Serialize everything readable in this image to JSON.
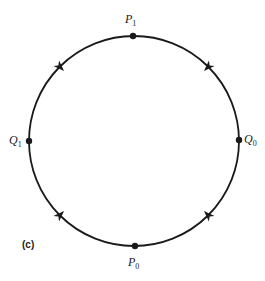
{
  "diagram": {
    "caption": "(c)",
    "circle": {
      "cx": 134,
      "cy": 141,
      "r": 105,
      "stroke": "#1a1a1a"
    },
    "points": [
      {
        "id": "P1",
        "letter": "P",
        "sub": "1",
        "x": 133,
        "y": 35
      },
      {
        "id": "Q1",
        "letter": "Q",
        "sub": "1",
        "x": 29,
        "y": 141
      },
      {
        "id": "Q0",
        "letter": "Q",
        "sub": "0",
        "x": 239,
        "y": 140
      },
      {
        "id": "P0",
        "letter": "P",
        "sub": "0",
        "x": 135,
        "y": 247
      }
    ],
    "arrows": [
      {
        "from": "Q1",
        "to": "P1",
        "angle_deg": 225
      },
      {
        "from": "Q0",
        "to": "P1",
        "angle_deg": 315
      },
      {
        "from": "Q1",
        "to": "P0",
        "angle_deg": 135
      },
      {
        "from": "Q0",
        "to": "P0",
        "angle_deg": 45
      }
    ]
  }
}
